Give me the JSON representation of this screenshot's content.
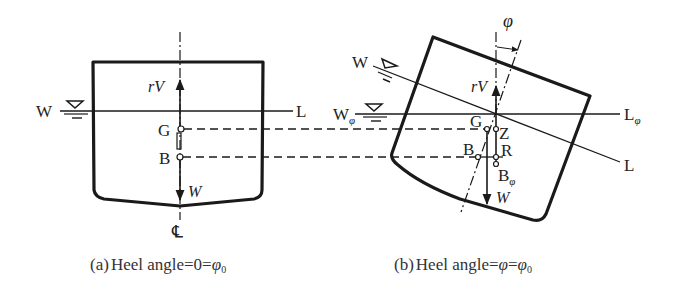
{
  "figure": {
    "panel_a": {
      "caption_tag": "(a)",
      "caption_text": "Heel angle=0=",
      "caption_sym": "φ",
      "caption_sub": "0",
      "waterline_left": "W",
      "waterline_right": "L",
      "buoyancy_force": "rV",
      "weight_force": "W",
      "center_gravity": "G",
      "center_buoyancy": "B",
      "centerline": "℄"
    },
    "panel_b": {
      "caption_tag": "(b)",
      "caption_text": "Heel angle=",
      "caption_sym1": "φ",
      "caption_eq": "=",
      "caption_sym2": "φ",
      "caption_sub": "0",
      "heel_angle": "φ",
      "inclined_waterline_left": "W",
      "inclined_waterline_right": "L",
      "waterline_phi_left": "W",
      "waterline_phi_left_sub": "φ",
      "waterline_phi_right": "L",
      "waterline_phi_right_sub": "φ",
      "buoyancy_force": "rV",
      "weight_force": "W",
      "center_gravity": "G",
      "point_z": "Z",
      "center_buoyancy": "B",
      "point_r": "R",
      "heeled_buoyancy": "B",
      "heeled_buoyancy_sub": "φ"
    }
  }
}
